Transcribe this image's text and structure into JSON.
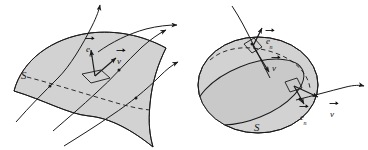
{
  "figure": {
    "background_color": "#ffffff",
    "stroke_color": "#1a1a1a",
    "surface_fill": "#d2d2d2",
    "surface_fill_alt": "#c9c9c9",
    "panels": [
      {
        "id": "left-panel",
        "name": "open-surface-panel",
        "surface_type": "open saddle surface",
        "surface_label": "S",
        "normal_vector_label": "e",
        "normal_vector_subscript": "n",
        "velocity_vector_label": "v",
        "patch_count": 1,
        "streamline_count": 4
      },
      {
        "id": "right-panel",
        "name": "closed-surface-panel",
        "surface_type": "closed sphere",
        "surface_label": "S",
        "normal_vector_label": "e",
        "normal_vector_subscript": "n",
        "velocity_vector_label": "v",
        "patch_count": 2,
        "streamline_count": 2
      }
    ],
    "labels": {
      "left_surface_S": "S",
      "left_en_sym": "e",
      "left_en_sub": "n",
      "left_v_sym": "v",
      "right_surface_S": "S",
      "right_en_top_sym": "e",
      "right_en_top_sub": "n",
      "right_v_top_sym": "v",
      "right_en_bottom_sym": "e",
      "right_en_bottom_sub": "n",
      "right_v_bottom_sym": "v"
    }
  }
}
